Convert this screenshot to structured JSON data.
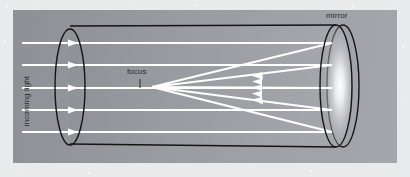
{
  "figure": {
    "kind": "optics-diagram"
  },
  "labels": {
    "mirror": "mirror",
    "focus": "focus",
    "incoming_light": "incoming light"
  },
  "colors": {
    "outer_background": "#e9eaec",
    "panel_left": "#8d9195",
    "panel_right": "#a3a7ab",
    "ray": "#ffffff",
    "outline": "#141414",
    "label_text": "#2b2b2b",
    "mirror_glow": "#ffffff"
  },
  "diagram_data": {
    "type": "ray-diagram",
    "tube": {
      "shape": "cylinder",
      "aperture_ellipse": {
        "cx": 70,
        "cy": 87,
        "rx": 15,
        "ry": 57
      },
      "mirror_ellipse": {
        "cx": 336,
        "cy": 86,
        "rx": 16,
        "ry": 61
      },
      "mirror_rim_ellipse": {
        "cx": 343,
        "cy": 86,
        "rx": 16,
        "ry": 61
      },
      "top_edge": [
        [
          70,
          26
        ],
        [
          336,
          25
        ]
      ],
      "bottom_edge": [
        [
          70,
          144
        ],
        [
          336,
          147
        ]
      ]
    },
    "focus_point": {
      "x": 152,
      "y": 87
    },
    "incoming_rays": [
      {
        "y": 43,
        "x_start": 22,
        "x_end": 100,
        "arrow_x": 72
      },
      {
        "y": 65,
        "x_start": 22,
        "x_end": 100,
        "arrow_x": 72
      },
      {
        "y": 88,
        "x_start": 22,
        "x_end": 100,
        "arrow_x": 72
      },
      {
        "y": 110,
        "x_start": 22,
        "x_end": 100,
        "arrow_x": 72
      },
      {
        "y": 132,
        "x_start": 22,
        "x_end": 100,
        "arrow_x": 72
      }
    ],
    "ray_paths_to_mirror": [
      {
        "from": [
          100,
          43
        ],
        "to": [
          332,
          43
        ]
      },
      {
        "from": [
          100,
          65
        ],
        "to": [
          332,
          65
        ]
      },
      {
        "from": [
          100,
          88
        ],
        "to": [
          332,
          88
        ]
      },
      {
        "from": [
          100,
          110
        ],
        "to": [
          332,
          110
        ]
      },
      {
        "from": [
          100,
          132
        ],
        "to": [
          332,
          132
        ]
      }
    ],
    "reflected_rays": [
      {
        "from": [
          332,
          43
        ],
        "to": [
          152,
          87
        ],
        "arrow_x": 258
      },
      {
        "from": [
          332,
          65
        ],
        "to": [
          152,
          87
        ],
        "arrow_x": 258
      },
      {
        "from": [
          332,
          88
        ],
        "to": [
          152,
          87
        ],
        "arrow_x": 258
      },
      {
        "from": [
          332,
          110
        ],
        "to": [
          152,
          87
        ],
        "arrow_x": 258
      },
      {
        "from": [
          332,
          132
        ],
        "to": [
          152,
          87
        ],
        "arrow_x": 258
      }
    ],
    "focus_leader_line": {
      "x": 140,
      "y_start": 79,
      "y_end": 88
    },
    "annotations": [
      "mirror",
      "focus",
      "incoming light"
    ]
  }
}
